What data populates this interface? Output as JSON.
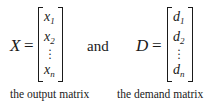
{
  "matrices": [
    {
      "name": "X",
      "equals": "=",
      "entries": [
        {
          "base": "x",
          "sub": "1"
        },
        {
          "base": "x",
          "sub": "2"
        },
        {
          "base": "⋮",
          "sub": ""
        },
        {
          "base": "x",
          "sub": "n"
        }
      ],
      "caption": "the output matrix"
    },
    {
      "name": "D",
      "equals": "=",
      "entries": [
        {
          "base": "d",
          "sub": "1"
        },
        {
          "base": "d",
          "sub": "2"
        },
        {
          "base": "⋮",
          "sub": ""
        },
        {
          "base": "d",
          "sub": "n"
        }
      ],
      "caption": "the demand matrix"
    }
  ],
  "connector": "and"
}
